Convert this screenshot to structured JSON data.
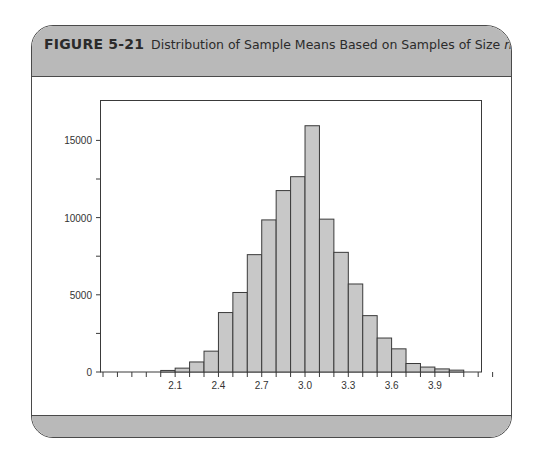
{
  "figure": {
    "label": "FIGURE 5-21",
    "caption_prefix": "Distribution of Sample Means Based on Samples of Size ",
    "caption_var": "n",
    "caption_suffix": " = 30"
  },
  "colors": {
    "header_band": "#b9b9b9",
    "bar_fill": "#c8c8c8",
    "bar_stroke": "#3a3a3a",
    "axis": "#3a3a3a"
  },
  "chart_data": {
    "type": "bar",
    "title": "Distribution of Sample Means Based on Samples of Size n = 30",
    "xlabel": "",
    "ylabel": "",
    "bin_width": 0.1,
    "bin_starts": [
      2.0,
      2.1,
      2.2,
      2.3,
      2.4,
      2.5,
      2.6,
      2.7,
      2.8,
      2.9,
      3.0,
      3.1,
      3.2,
      3.3,
      3.4,
      3.5,
      3.6,
      3.7,
      3.8,
      3.9,
      4.0
    ],
    "values": [
      100,
      250,
      650,
      1350,
      3850,
      5150,
      7600,
      9850,
      11750,
      12650,
      15950,
      9900,
      7750,
      5700,
      3650,
      2200,
      1500,
      550,
      320,
      200,
      120
    ],
    "x_ticks": [
      1.6,
      1.7,
      1.8,
      1.9,
      2.0,
      2.1,
      2.2,
      2.3,
      2.4,
      2.5,
      2.6,
      2.7,
      2.8,
      2.9,
      3.0,
      3.1,
      3.2,
      3.3,
      3.4,
      3.5,
      3.6,
      3.7,
      3.8,
      3.9,
      4.0,
      4.1,
      4.2,
      4.3
    ],
    "x_tick_labels": [
      "2.1",
      "2.4",
      "2.7",
      "3.0",
      "3.3",
      "3.6",
      "3.9"
    ],
    "y_ticks": [
      0,
      2500,
      5000,
      7500,
      10000,
      12500,
      15000
    ],
    "y_tick_labels": [
      "0",
      "5000",
      "10000",
      "15000"
    ],
    "ylim": [
      0,
      17000
    ],
    "xlim": [
      1.58,
      4.36
    ],
    "grid": false,
    "legend": null
  }
}
